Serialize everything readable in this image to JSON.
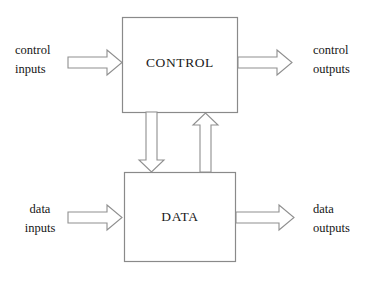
{
  "diagram": {
    "background_color": "#ffffff",
    "line_color": "#8a8a8a",
    "text_color": "#1a1a1a",
    "blocks": [
      {
        "id": "control",
        "label": "CONTROL",
        "x": 122,
        "y": 17,
        "width": 116,
        "height": 96
      },
      {
        "id": "data",
        "label": "DATA",
        "x": 124,
        "y": 172,
        "width": 112,
        "height": 90
      }
    ],
    "labels": {
      "control_inputs_line1": "control",
      "control_inputs_line2": "inputs",
      "control_outputs_line1": "control",
      "control_outputs_line2": "outputs",
      "data_inputs_line1": "data",
      "data_inputs_line2": "inputs",
      "data_outputs_line1": "data",
      "data_outputs_line2": "outputs"
    },
    "arrows": [
      {
        "id": "control-inputs-arrow",
        "direction": "right",
        "from": "control inputs",
        "to": "CONTROL"
      },
      {
        "id": "control-outputs-arrow",
        "direction": "right",
        "from": "CONTROL",
        "to": "control outputs"
      },
      {
        "id": "data-inputs-arrow",
        "direction": "right",
        "from": "data inputs",
        "to": "DATA"
      },
      {
        "id": "data-outputs-arrow",
        "direction": "right",
        "from": "DATA",
        "to": "data outputs"
      },
      {
        "id": "control-to-data-arrow",
        "direction": "down",
        "from": "CONTROL",
        "to": "DATA"
      },
      {
        "id": "data-to-control-arrow",
        "direction": "up",
        "from": "DATA",
        "to": "CONTROL"
      }
    ]
  }
}
